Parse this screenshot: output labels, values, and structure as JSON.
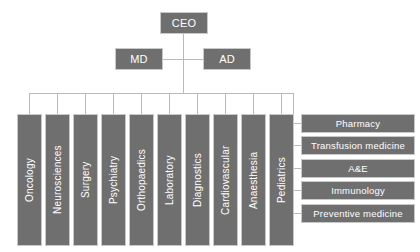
{
  "diagram": {
    "box_fill": "#6f6f6f",
    "box_border": "#c9c9c9",
    "connector_color": "#b9b9b9",
    "text_color": "#ffffff",
    "background": "#ffffff"
  },
  "executive": {
    "ceo": {
      "label": "CEO"
    },
    "md": {
      "label": "MD"
    },
    "ad": {
      "label": "AD"
    }
  },
  "clinical_departments": [
    {
      "label": "Oncology"
    },
    {
      "label": "Neurosciences"
    },
    {
      "label": "Surgery"
    },
    {
      "label": "Psychiatry"
    },
    {
      "label": "Orthopaedics"
    },
    {
      "label": "Laboratory"
    },
    {
      "label": "Diagnostics"
    },
    {
      "label": "Cardiovascular"
    },
    {
      "label": "Anaesthesia"
    },
    {
      "label": "Pediatrics"
    }
  ],
  "support_services": [
    {
      "label": "Pharmacy"
    },
    {
      "label": "Transfusion medicine"
    },
    {
      "label": "A&E"
    },
    {
      "label": "Immunology"
    },
    {
      "label": "Preventive medicine"
    }
  ]
}
